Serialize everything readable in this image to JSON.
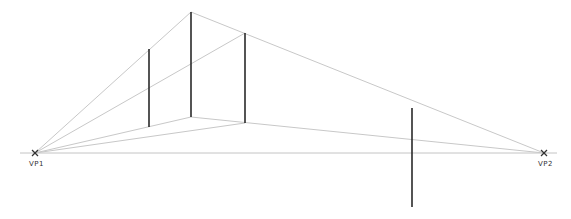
{
  "diagram": {
    "vanishing_points": [
      {
        "id": "vp1",
        "label": "VP1"
      },
      {
        "id": "vp2",
        "label": "VP2"
      }
    ],
    "colors": {
      "guide_lines": "#c8c8c8",
      "edges": "#2a2a2a",
      "labels": "#333333"
    }
  }
}
